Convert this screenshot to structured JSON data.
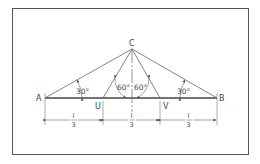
{
  "diagram": {
    "points": {
      "A": {
        "label": "A"
      },
      "B": {
        "label": "B"
      },
      "C": {
        "label": "C"
      },
      "U": {
        "label": "U"
      },
      "V": {
        "label": "V"
      }
    },
    "angles": {
      "left_base": "30°",
      "center_left": "60°",
      "center_right": "60°",
      "right_base": "30°"
    },
    "dimensions": [
      {
        "numerator": "l",
        "denominator": "3"
      },
      {
        "numerator": "l",
        "denominator": "3"
      },
      {
        "numerator": "l",
        "denominator": "3"
      }
    ],
    "colors": {
      "line": "#555555",
      "text": "#444444",
      "frame": "#555555"
    }
  }
}
